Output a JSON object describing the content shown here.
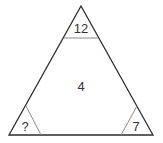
{
  "diagram": {
    "type": "number-triangle-puzzle",
    "corners": {
      "top": "12",
      "bottom_left": "?",
      "bottom_right": "7"
    },
    "center": "4",
    "colors": {
      "outline": "#2b2b2b",
      "inner_lines": "#8a8a8a",
      "text": "#333333"
    }
  }
}
